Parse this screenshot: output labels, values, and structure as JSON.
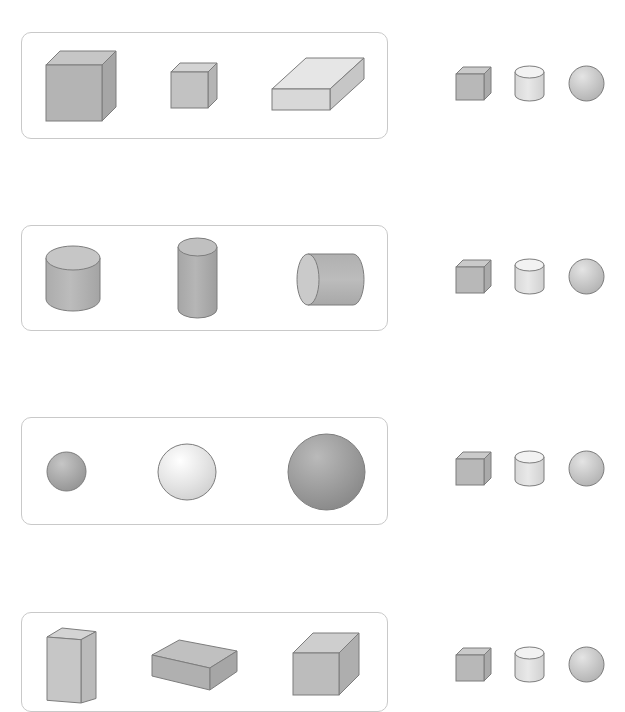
{
  "worksheet": {
    "rows": [
      {
        "group_label": "cuboids",
        "card": {
          "top": 32,
          "height": 107
        },
        "shapes": [
          {
            "type": "cube",
            "name": "large-cube",
            "x": 46,
            "y": 51,
            "w": 70,
            "h": 70,
            "fill": "#b4b4b4"
          },
          {
            "type": "cube",
            "name": "small-cube",
            "x": 171,
            "y": 63,
            "w": 46,
            "h": 45,
            "fill": "#c2c2c2"
          },
          {
            "type": "slab",
            "name": "flat-cuboid",
            "x": 272,
            "y": 58,
            "w": 92,
            "h": 52,
            "fill": "#d8d8d8"
          }
        ],
        "choices_top": 67
      },
      {
        "group_label": "cylinders",
        "card": {
          "top": 225,
          "height": 106
        },
        "shapes": [
          {
            "type": "cylinder",
            "name": "short-cylinder",
            "x": 46,
            "y": 246,
            "w": 54,
            "h": 65,
            "fill": "#b2b2b2"
          },
          {
            "type": "cylinder",
            "name": "tall-cylinder",
            "x": 178,
            "y": 238,
            "w": 39,
            "h": 80,
            "fill": "#acacac"
          },
          {
            "type": "hcylinder",
            "name": "horizontal-cylinder",
            "x": 297,
            "y": 254,
            "w": 67,
            "h": 51,
            "fill": "#b4b4b4"
          }
        ],
        "choices_top": 260
      },
      {
        "group_label": "spheres",
        "card": {
          "top": 417,
          "height": 108
        },
        "shapes": [
          {
            "type": "sphere",
            "name": "small-sphere",
            "x": 47,
            "y": 452,
            "w": 39,
            "h": 39,
            "fill": "#a8a8a8"
          },
          {
            "type": "sphere",
            "name": "light-sphere",
            "x": 158,
            "y": 444,
            "w": 58,
            "h": 56,
            "fill": "#e4e4e4"
          },
          {
            "type": "sphere",
            "name": "large-sphere",
            "x": 288,
            "y": 434,
            "w": 77,
            "h": 76,
            "fill": "#9c9c9c"
          }
        ],
        "choices_top": 452
      },
      {
        "group_label": "prisms",
        "card": {
          "top": 612,
          "height": 100
        },
        "shapes": [
          {
            "type": "tallbox",
            "name": "tall-prism",
            "x": 47,
            "y": 628,
            "w": 49,
            "h": 75,
            "fill": "#c6c6c6"
          },
          {
            "type": "slab2",
            "name": "flat-box",
            "x": 152,
            "y": 640,
            "w": 85,
            "h": 50,
            "fill": "#b0b0b0"
          },
          {
            "type": "cube2",
            "name": "cube-box",
            "x": 293,
            "y": 633,
            "w": 66,
            "h": 62,
            "fill": "#bcbcbc"
          }
        ],
        "choices_top": 648
      }
    ],
    "choices": [
      {
        "type": "cube",
        "label": "cube-option",
        "x": 456
      },
      {
        "type": "cylinder",
        "label": "cylinder-option",
        "x": 515
      },
      {
        "type": "sphere",
        "label": "sphere-option",
        "x": 569
      }
    ],
    "colors": {
      "stroke": "#7d7d7d",
      "card_border": "#c9c9c9",
      "choice_cube": "#b8b8b8",
      "choice_cyl": "#dedede",
      "choice_sphere": "#c6c6c6"
    }
  }
}
